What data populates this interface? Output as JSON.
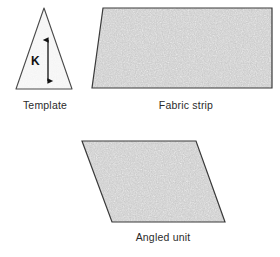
{
  "figure": {
    "background_color": "#ffffff",
    "outline_color": "#3a3a3a",
    "fill_gray": "#c6c6c6",
    "fill_light": "#f2f2f2"
  },
  "shapes": {
    "template": {
      "name": "Template",
      "type": "triangle",
      "caption": "Template",
      "fill": "#f4f4f4",
      "points": "44,8 72,89 16,89",
      "measure_label": "K",
      "measure_arrow": {
        "orientation": "vertical",
        "double_headed": true,
        "x": 48,
        "y_top": 37,
        "y_bottom": 84
      }
    },
    "fabric_strip": {
      "name": "Fabric strip",
      "type": "quadrilateral",
      "caption": "Fabric strip",
      "fill": "#c6c6c6",
      "points": "103,8 272,8 272,88 92,88"
    },
    "angled_unit": {
      "name": "Angled unit",
      "type": "parallelogram",
      "caption": "Angled unit",
      "fill": "#c6c6c6",
      "points": "82,141 196,141 225,222 112,222"
    }
  },
  "captions": {
    "template": "Template",
    "fabric_strip": "Fabric strip",
    "angled_unit": "Angled unit"
  }
}
